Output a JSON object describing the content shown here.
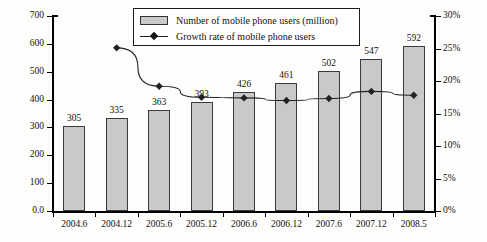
{
  "chart_data": {
    "type": "bar",
    "title": "",
    "xlabel": "",
    "ylabel": "Million",
    "y2label": "",
    "categories": [
      "2004.6",
      "2004.12",
      "2005.6",
      "2005.12",
      "2006.6",
      "2006.12",
      "2007.6",
      "2007.12",
      "2008.5"
    ],
    "ylim": [
      0,
      700
    ],
    "y2lim": [
      0,
      30
    ],
    "yticks": [
      "0.0",
      "100",
      "200",
      "300",
      "400",
      "500",
      "600",
      "700"
    ],
    "ytick_values": [
      0,
      100,
      200,
      300,
      400,
      500,
      600,
      700
    ],
    "y2ticks": [
      "0%",
      "5%",
      "10%",
      "15%",
      "20%",
      "25%",
      "30%"
    ],
    "y2tick_values": [
      0,
      5,
      10,
      15,
      20,
      25,
      30
    ],
    "grid": false,
    "legend_position": "top-center",
    "series": [
      {
        "name": "Number of mobile phone users (million)",
        "type": "bar",
        "axis": "left",
        "color": "#c9c9c9",
        "values": [
          305,
          335,
          363,
          393,
          426,
          461,
          502,
          547,
          592
        ],
        "labels": [
          "305",
          "335",
          "363",
          "393",
          "426",
          "461",
          "502",
          "547",
          "592"
        ]
      },
      {
        "name": "Growth rate of mobile phone users",
        "type": "line",
        "axis": "right",
        "color": "#222222",
        "values": [
          null,
          25.1,
          19.2,
          17.5,
          17.4,
          17.0,
          17.3,
          18.4,
          17.8
        ]
      }
    ]
  },
  "legend": {
    "items": [
      {
        "label": "Number of mobile phone users (million)",
        "marker": "bar-swatch"
      },
      {
        "label": "Growth rate of mobile phone users",
        "marker": "line-diamond"
      }
    ]
  },
  "axes": {
    "left_title": "Million"
  }
}
